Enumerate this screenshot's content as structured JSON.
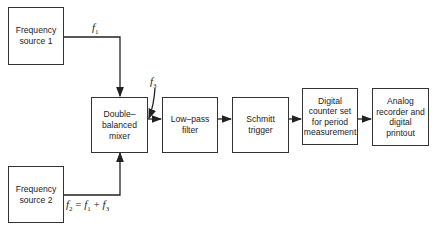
{
  "blocks": {
    "source1": "Frequency source 1",
    "source2": "Frequency source 2",
    "mixer": "Double–balanced mixer",
    "lowpass": "Low–pass filter",
    "schmitt": "Schmitt trigger",
    "counter": "Digital counter set for period measurement",
    "recorder": "Analog recorder and digital printout"
  },
  "signals": {
    "f1": "f",
    "f1_sub": "1",
    "f3": "f",
    "f3_sub": "3",
    "f2_eq": {
      "a": "f",
      "a_sub": "2",
      "op1": " = ",
      "b": "f",
      "b_sub": "1",
      "op2": " + ",
      "c": "f",
      "c_sub": "3"
    }
  }
}
